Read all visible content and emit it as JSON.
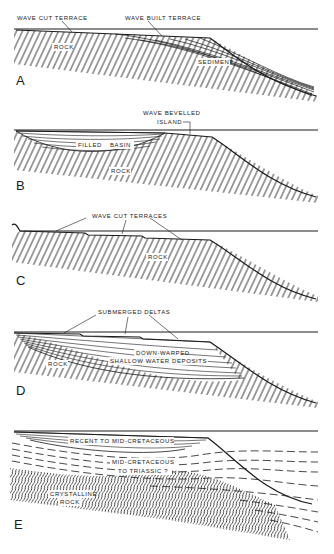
{
  "figure": {
    "panels": [
      {
        "letter": "A",
        "labels": {
          "wave_cut_terrace": "WAVE CUT TERRACE",
          "wave_built_terrace": "WAVE BUILT TERRACE",
          "rock": "ROCK",
          "sediment": "SEDIMENT"
        }
      },
      {
        "letter": "B",
        "labels": {
          "wave_bevelled_1": "WAVE BEVELLED",
          "wave_bevelled_2": "ISLAND",
          "filled": "FILLED",
          "basin": "BASIN",
          "rock": "ROCK"
        }
      },
      {
        "letter": "C",
        "labels": {
          "wave_cut_terraces": "WAVE CUT TERRACES",
          "rock": "ROCK"
        }
      },
      {
        "letter": "D",
        "labels": {
          "submerged_deltas": "SUBMERGED DELTAS",
          "down_warped": "DOWN-WARPED",
          "shallow_water": "SHALLOW WATER DEPOSITS",
          "rock": "ROCK"
        }
      },
      {
        "letter": "E",
        "labels": {
          "recent": "RECENT TO MID-CRETACEOUS",
          "mid_cret_1": "MID-CRETACEOUS",
          "mid_cret_2": "TO TRIASSIC ?",
          "crystalline_1": "CRYSTALLINE",
          "crystalline_2": "ROCK"
        }
      }
    ]
  }
}
